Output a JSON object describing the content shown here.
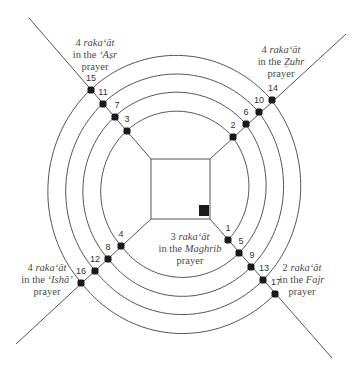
{
  "diagram": {
    "title": "",
    "center": [
      176,
      193
    ],
    "square": {
      "x": 151,
      "y": 159,
      "w": 59,
      "h": 60
    },
    "marker": {
      "x": 199,
      "y": 205,
      "w": 10,
      "h": 11
    },
    "colors": {
      "line": "#555555",
      "dot": "#1a1a1a",
      "text": "#4a4a4a",
      "background": "#ffffff"
    },
    "diagonals": [
      {
        "id": "asr",
        "from": [
          29,
          18
        ],
        "to": [
          151,
          159
        ]
      },
      {
        "id": "zuhr",
        "from": [
          346,
          34
        ],
        "to": [
          210,
          159
        ]
      },
      {
        "id": "isha",
        "from": [
          16,
          344
        ],
        "to": [
          151,
          219
        ]
      },
      {
        "id": "fajr",
        "from": [
          332,
          358
        ],
        "to": [
          210,
          219
        ]
      }
    ],
    "dots": [
      {
        "n": "1",
        "x": 228,
        "y": 240,
        "lx": 228,
        "ly": 231
      },
      {
        "n": "2",
        "x": 233,
        "y": 137,
        "lx": 233,
        "ly": 128
      },
      {
        "n": "3",
        "x": 127,
        "y": 131,
        "lx": 127,
        "ly": 122
      },
      {
        "n": "4",
        "x": 121,
        "y": 246,
        "lx": 121,
        "ly": 237
      },
      {
        "n": "5",
        "x": 239,
        "y": 253,
        "lx": 241,
        "ly": 244
      },
      {
        "n": "6",
        "x": 246,
        "y": 124,
        "lx": 246,
        "ly": 115
      },
      {
        "n": "7",
        "x": 115,
        "y": 117,
        "lx": 117,
        "ly": 108
      },
      {
        "n": "8",
        "x": 108,
        "y": 259,
        "lx": 108,
        "ly": 250
      },
      {
        "n": "9",
        "x": 251,
        "y": 267,
        "lx": 252,
        "ly": 258
      },
      {
        "n": "10",
        "x": 259,
        "y": 112,
        "lx": 259,
        "ly": 103
      },
      {
        "n": "11",
        "x": 103,
        "y": 104,
        "lx": 103,
        "ly": 95
      },
      {
        "n": "12",
        "x": 95,
        "y": 271,
        "lx": 95,
        "ly": 262
      },
      {
        "n": "13",
        "x": 263,
        "y": 280,
        "lx": 264,
        "ly": 271
      },
      {
        "n": "14",
        "x": 272,
        "y": 100,
        "lx": 273,
        "ly": 91
      },
      {
        "n": "15",
        "x": 91,
        "y": 90,
        "lx": 91,
        "ly": 81
      },
      {
        "n": "16",
        "x": 81,
        "y": 283,
        "lx": 81,
        "ly": 274
      },
      {
        "n": "17",
        "x": 275,
        "y": 294,
        "lx": 276,
        "ly": 285
      }
    ],
    "labels": {
      "asr": {
        "count": "4",
        "unit": "raka‘āt",
        "prefix": "in the",
        "name": "‘Aṣr",
        "suffix": "prayer",
        "x": 95,
        "y": 37
      },
      "zuhr": {
        "count": "4",
        "unit": "raka‘āt",
        "prefix": "in the",
        "name": "Ẓuhr",
        "suffix": "prayer",
        "x": 281,
        "y": 44
      },
      "maghrib": {
        "count": "3",
        "unit": "raka‘āt",
        "prefix": "in the",
        "name": "Maghrib",
        "suffix": "prayer",
        "x": 190,
        "y": 231
      },
      "isha": {
        "count": "4",
        "unit": "raka‘āt",
        "prefix": "in the",
        "name": "‘Ishā’",
        "suffix": "prayer",
        "x": 47,
        "y": 262
      },
      "fajr": {
        "count": "2",
        "unit": "raka‘āt",
        "prefix": "in the",
        "name": "Fajr",
        "suffix": "prayer",
        "x": 302,
        "y": 262
      }
    }
  }
}
